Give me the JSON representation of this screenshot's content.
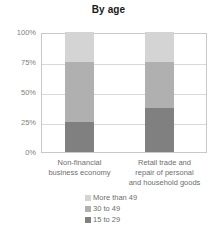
{
  "chart_data": {
    "type": "bar",
    "subtype": "stacked-100-percent",
    "title": "By age",
    "xlabel": "",
    "ylabel": "",
    "ylim": [
      0,
      100
    ],
    "ytick_labels": [
      "100%",
      "75%",
      "50%",
      "25%",
      "0%"
    ],
    "ytick_values": [
      100,
      75,
      50,
      25,
      0
    ],
    "grid": true,
    "legend_position": "bottom-right",
    "categories": [
      "Non-financial business economy",
      "Retail trade and repair of personal and household goods"
    ],
    "category_lines": [
      [
        "Non-financial",
        "business economy"
      ],
      [
        "Retail trade and",
        "repair of personal",
        "and household goods"
      ]
    ],
    "series": [
      {
        "name": "15 to 29",
        "values": [
          25,
          37
        ],
        "color": "#808080"
      },
      {
        "name": "30 to 49",
        "values": [
          50,
          38
        ],
        "color": "#b0b0b0"
      },
      {
        "name": "More than 49",
        "values": [
          25,
          25
        ],
        "color": "#d4d4d4"
      }
    ],
    "legend_order": [
      "More than 49",
      "30 to 49",
      "15 to 29"
    ]
  },
  "colors": {
    "more_than_49": "#d4d4d4",
    "age_30_to_49": "#b0b0b0",
    "age_15_to_29": "#808080",
    "gridline": "#d9d9d9",
    "axis": "#c8c8c8",
    "title_text": "#1a1a1a",
    "label_text": "#6e6e6e",
    "tick_text": "#808080",
    "background": "#ffffff"
  }
}
